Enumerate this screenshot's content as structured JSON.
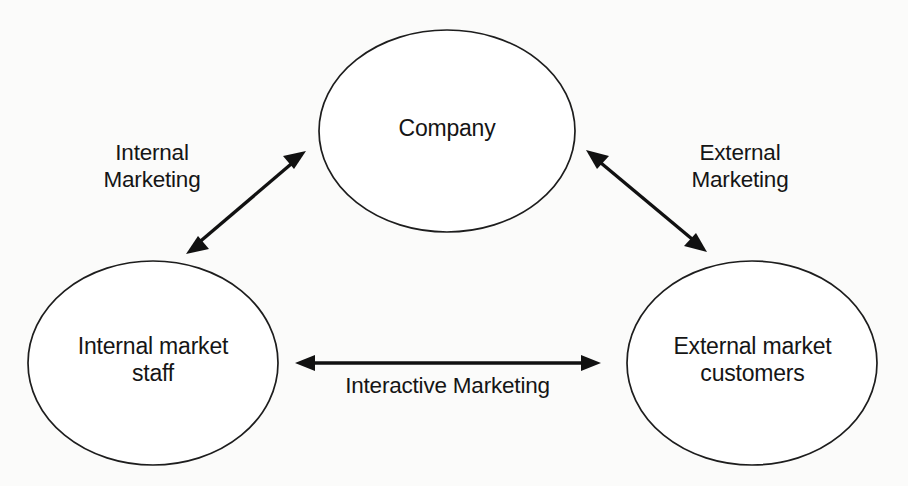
{
  "diagram": {
    "background_color": "#fbfbfa",
    "stroke_color": "#111111",
    "node_fill": "#ffffff",
    "nodes": [
      {
        "id": "company",
        "label": "Company",
        "shape": "ellipse",
        "cx": 447,
        "cy": 131,
        "rx": 128,
        "ry": 101
      },
      {
        "id": "internal-market",
        "label": "Internal market\nstaff",
        "shape": "ellipse",
        "cx": 153,
        "cy": 363,
        "rx": 125,
        "ry": 102
      },
      {
        "id": "external-market",
        "label": "External market\ncustomers",
        "shape": "ellipse",
        "cx": 752,
        "cy": 363,
        "rx": 125,
        "ry": 102
      }
    ],
    "edges": [
      {
        "id": "internal-marketing",
        "label": "Internal\nMarketing",
        "from": "internal-market",
        "to": "company",
        "direction": "bidirectional",
        "x1": 186,
        "y1": 254,
        "x2": 306,
        "y2": 151
      },
      {
        "id": "external-marketing",
        "label": "External\nMarketing",
        "from": "company",
        "to": "external-market",
        "direction": "bidirectional",
        "x1": 586,
        "y1": 150,
        "x2": 707,
        "y2": 252
      },
      {
        "id": "interactive-marketing",
        "label": "Interactive Marketing",
        "from": "internal-market",
        "to": "external-market",
        "direction": "bidirectional",
        "x1": 295,
        "y1": 363,
        "x2": 601,
        "y2": 363
      }
    ]
  }
}
